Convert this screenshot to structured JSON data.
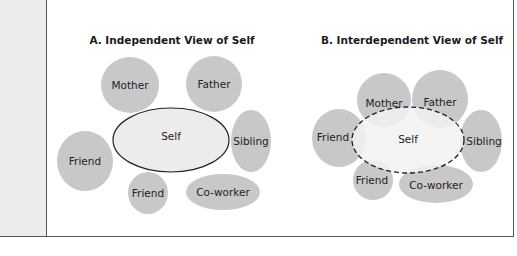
{
  "sidebar": {
    "title": "f Self",
    "lines": [
      {
        "text": "ent",
        "italic": false
      },
      {
        "text": " con-",
        "italic": false
      },
      {
        "text": "ny west-",
        "italic": false
      },
      {
        "text": "dent",
        "italic": true
      },
      {
        "text": "tity",
        "italic": false
      },
      {
        "text": "nous,",
        "italic": false
      },
      {
        "text": "many",
        "italic": false
      },
      {
        "text": "tin",
        "italic": false
      },
      {
        "text": "de-",
        "italic": true
      },
      {
        "text": "f that",
        "italic": false
      },
      {
        "text": "a larger",
        "italic": false
      }
    ]
  },
  "colors": {
    "circle_fill": "#c8c8c8",
    "self_fill_a": "#ececec",
    "self_fill_b": "#eeeeee",
    "outline": "#222222",
    "sidebar_bg": "#ececec"
  },
  "panel_a": {
    "title": "A. Independent View of Self",
    "self": {
      "label": "Self",
      "border": "solid"
    },
    "others": [
      {
        "label": "Mother"
      },
      {
        "label": "Father"
      },
      {
        "label": "Sibling"
      },
      {
        "label": "Friend"
      },
      {
        "label": "Friend"
      },
      {
        "label": "Co-worker"
      }
    ]
  },
  "panel_b": {
    "title": "B. Interdependent View of Self",
    "self": {
      "label": "Self",
      "border": "dashed"
    },
    "others": [
      {
        "label": "Mother"
      },
      {
        "label": "Father"
      },
      {
        "label": "Sibling"
      },
      {
        "label": "Friend"
      },
      {
        "label": "Friend"
      },
      {
        "label": "Co-worker"
      }
    ]
  }
}
